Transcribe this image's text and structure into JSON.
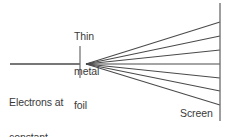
{
  "figure": {
    "background_color": "#ffffff",
    "line_color": "#4a4a4a",
    "text_color": "#3a3a3a",
    "width": 236,
    "height": 137
  },
  "labels": {
    "foil": "Thin\nmetal\nfoil",
    "foil_line1": "Thin",
    "foil_line2": "metal",
    "foil_line3": "foil",
    "source": "Electrons at\nconstant\nspeed",
    "source_line1": "Electrons at",
    "source_line2": "constant",
    "source_line3": "speed",
    "screen": "Screen"
  },
  "geometry": {
    "incident_beam": {
      "x1": 10,
      "y1": 64,
      "x2": 80,
      "y2": 64
    },
    "foil_tick": {
      "x": 80,
      "y1": 46,
      "y2": 78
    },
    "scatter_origin": {
      "x": 86,
      "y": 64
    },
    "screen_line": {
      "x": 220,
      "y1": 3,
      "y2": 121
    },
    "scattered_rays": [
      {
        "name": "ray-1",
        "end_x": 220,
        "end_y": 22
      },
      {
        "name": "ray-2",
        "end_x": 220,
        "end_y": 36
      },
      {
        "name": "ray-3",
        "end_x": 220,
        "end_y": 50
      },
      {
        "name": "ray-4",
        "end_x": 220,
        "end_y": 64
      },
      {
        "name": "ray-5",
        "end_x": 220,
        "end_y": 78
      },
      {
        "name": "ray-6",
        "end_x": 220,
        "end_y": 91
      },
      {
        "name": "ray-7",
        "end_x": 220,
        "end_y": 105
      }
    ],
    "ray_count": 7
  }
}
